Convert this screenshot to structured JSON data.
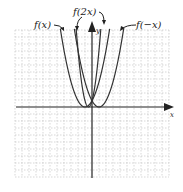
{
  "chart_data": {
    "type": "line",
    "title": "",
    "xlabel": "x",
    "ylabel": "y",
    "grid": true,
    "xlim": [
      -11,
      11
    ],
    "ylim": [
      -10,
      11
    ],
    "series": [
      {
        "name": "f(x)",
        "expression": "(x+1)^2",
        "vertex": [
          -1,
          0
        ]
      },
      {
        "name": "f(2x)",
        "expression": "(2x+1)^2",
        "vertex": [
          -0.5,
          0
        ]
      },
      {
        "name": "f(-x)",
        "expression": "(x-1)^2",
        "vertex": [
          1,
          0
        ]
      }
    ],
    "annotations": [
      {
        "text": "f(x)",
        "points_to": "left branch of f(x)"
      },
      {
        "text": "f(2x)",
        "points_to": "both branches of f(2x)"
      },
      {
        "text": "f(−x)",
        "points_to": "right branch of f(−x)"
      }
    ]
  },
  "labels": {
    "fx": "f(x)",
    "f2x": "f(2x)",
    "fnegx": "f(−x)",
    "x_axis": "x",
    "y_axis": "y"
  },
  "colors": {
    "axis": "#222222",
    "curve": "#333333",
    "grid": "#bdbdbd"
  }
}
